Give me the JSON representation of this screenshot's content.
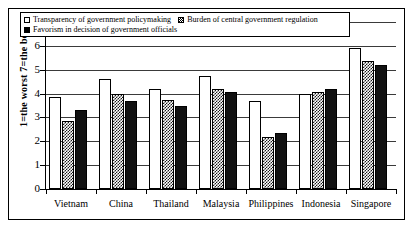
{
  "chart_data": {
    "type": "bar",
    "title": "",
    "xlabel": "",
    "ylabel": "1=the worst 7=the best",
    "ylim": [
      0,
      7
    ],
    "yticks": [
      "0",
      "1",
      "2",
      "3",
      "4",
      "5",
      "6",
      "7"
    ],
    "grid": true,
    "legend_position": "top-inside",
    "categories": [
      "Vietnam",
      "China",
      "Thailand",
      "Malaysia",
      "Philippines",
      "Indonesia",
      "Singapore"
    ],
    "series": [
      {
        "name": "Transparency of government policymaking",
        "marker": "open-square",
        "fill": "white",
        "values": [
          3.85,
          4.6,
          4.2,
          4.75,
          3.7,
          4.0,
          5.9
        ]
      },
      {
        "name": "Burden of central government regulation",
        "marker": "checkered-square",
        "fill": "hatched",
        "values": [
          2.85,
          4.0,
          3.75,
          4.2,
          2.2,
          4.05,
          5.35
        ]
      },
      {
        "name": "Favorism in decision of government officials",
        "marker": "filled-square",
        "fill": "black",
        "values": [
          3.3,
          3.7,
          3.5,
          4.05,
          2.35,
          4.2,
          5.2
        ]
      }
    ]
  },
  "colors": {
    "axis": "#000000",
    "grid": "#3a3a3a",
    "series_white": "#ffffff",
    "series_black": "#111111",
    "background": "#ffffff"
  }
}
